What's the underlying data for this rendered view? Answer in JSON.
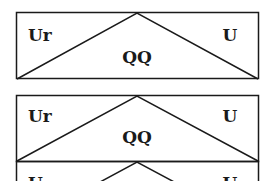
{
  "diagram": {
    "panels": [
      {
        "left_label": "Ur",
        "center_label": "QQ",
        "right_label": "U"
      },
      {
        "left_label": "Ur",
        "center_label": "QQ",
        "right_label": "U"
      },
      {
        "left_label": "U",
        "center_label": "",
        "right_label": "U"
      }
    ],
    "colors": {
      "line": "#1a1a1a",
      "background": "#ffffff"
    }
  }
}
